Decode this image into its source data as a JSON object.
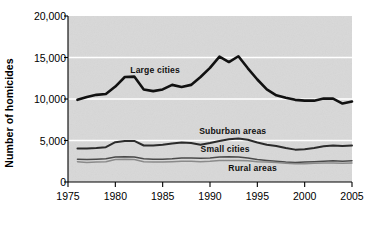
{
  "chart_data": {
    "type": "line",
    "title": "",
    "xlabel": "",
    "ylabel": "Number of homicides",
    "xlim": [
      1975,
      2005
    ],
    "ylim": [
      0,
      20000
    ],
    "grid": true,
    "gridlines_y": [
      5000,
      10000,
      15000
    ],
    "legend_position": "inline-annotations",
    "y_ticks": [
      {
        "value": 20000,
        "label": "20,000"
      },
      {
        "value": 15000,
        "label": "15,000"
      },
      {
        "value": 10000,
        "label": "10,000"
      },
      {
        "value": 5000,
        "label": "5,000"
      },
      {
        "value": 0,
        "label": "0"
      }
    ],
    "x_ticks": [
      {
        "value": 1975,
        "label": "1975"
      },
      {
        "value": 1980,
        "label": "1980"
      },
      {
        "value": 1985,
        "label": "1985"
      },
      {
        "value": 1990,
        "label": "1990"
      },
      {
        "value": 1995,
        "label": "1995"
      },
      {
        "value": 2000,
        "label": "2000"
      },
      {
        "value": 2005,
        "label": "2005"
      }
    ],
    "x": [
      1976,
      1977,
      1978,
      1979,
      1980,
      1981,
      1982,
      1983,
      1984,
      1985,
      1986,
      1987,
      1988,
      1989,
      1990,
      1991,
      1992,
      1993,
      1994,
      1995,
      1996,
      1997,
      1998,
      1999,
      2000,
      2001,
      2002,
      2003,
      2004,
      2005
    ],
    "series": [
      {
        "name": "Large cities",
        "color": "#111111",
        "width": 2.6,
        "label_x": 1984.2,
        "label_y": 13450,
        "values": [
          9900,
          10250,
          10500,
          10600,
          11500,
          12650,
          12700,
          11150,
          10950,
          11150,
          11700,
          11450,
          11700,
          12650,
          13750,
          15100,
          14450,
          15150,
          13700,
          12350,
          11150,
          10450,
          10150,
          9900,
          9800,
          9800,
          10050,
          10050,
          9450,
          9700
        ]
      },
      {
        "name": "Suburban areas",
        "color": "#2b2b2b",
        "width": 2.0,
        "label_x": 1992.4,
        "label_y": 6150,
        "values": [
          4050,
          4050,
          4100,
          4200,
          4800,
          4950,
          4950,
          4400,
          4400,
          4500,
          4650,
          4750,
          4700,
          4500,
          4700,
          4950,
          5150,
          5250,
          5100,
          4750,
          4500,
          4350,
          4100,
          3900,
          3950,
          4100,
          4300,
          4400,
          4350,
          4400
        ]
      },
      {
        "name": "Small cities",
        "color": "#4a4a4a",
        "width": 1.5,
        "label_x": 1991.6,
        "label_y": 4000,
        "values": [
          2750,
          2700,
          2750,
          2800,
          3000,
          3050,
          3000,
          2800,
          2750,
          2750,
          2800,
          2900,
          2900,
          2850,
          2900,
          3000,
          3050,
          3000,
          2900,
          2700,
          2600,
          2500,
          2400,
          2350,
          2400,
          2450,
          2500,
          2550,
          2500,
          2550
        ]
      },
      {
        "name": "Rural areas",
        "color": "#8a8a8a",
        "width": 1.5,
        "label_x": 1994.5,
        "label_y": 1650,
        "values": [
          2450,
          2350,
          2400,
          2450,
          2700,
          2750,
          2700,
          2450,
          2400,
          2400,
          2450,
          2500,
          2500,
          2450,
          2500,
          2600,
          2600,
          2600,
          2550,
          2450,
          2400,
          2350,
          2250,
          2200,
          2200,
          2250,
          2300,
          2300,
          2250,
          2300
        ]
      }
    ],
    "plot_background": "#d8d8d8",
    "gridline_color": "#ffffff",
    "axis_color": "#000000"
  }
}
